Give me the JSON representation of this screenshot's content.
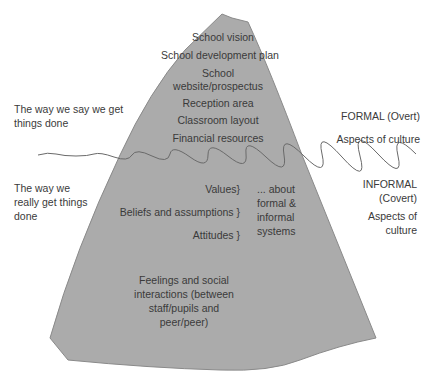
{
  "diagram": {
    "type": "iceberg",
    "colors": {
      "iceberg_fill": "#ababab",
      "iceberg_outline": "#8a8a8a",
      "waterline": "#6a6a6a",
      "text": "#3a3a3a"
    },
    "above_water": {
      "items": [
        "School vision",
        "School development plan",
        "School",
        "website/prospectus",
        "Reception area",
        "Classroom layout",
        "Financial resources"
      ],
      "left_label": [
        "The way we say we get",
        "things done"
      ],
      "right_label": "FORMAL (Overt)",
      "right_sublabel": "Aspects of culture"
    },
    "below_water": {
      "items": [
        "Values}",
        "Beliefs and assumptions }",
        "Attitudes }"
      ],
      "bracket_note": [
        "... about",
        "formal &",
        "informal",
        "systems"
      ],
      "deep_item": [
        "Feelings and social",
        "interactions (between",
        "staff/pupils and",
        "peer/peer)"
      ],
      "left_label": [
        "The way we",
        "really get things",
        "done"
      ],
      "right_label": [
        "INFORMAL",
        "(Covert)"
      ],
      "right_sublabel": [
        "Aspects of",
        "culture"
      ]
    }
  }
}
